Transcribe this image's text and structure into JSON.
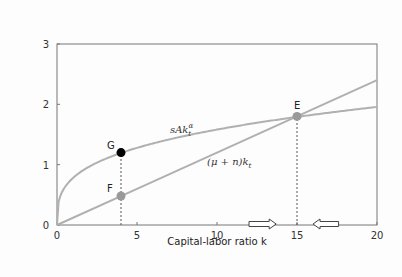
{
  "chart_data": {
    "type": "line",
    "title": "",
    "xlabel": "Capital-labor ratio k",
    "ylabel": "",
    "xlim": [
      0,
      20
    ],
    "ylim": [
      0,
      3
    ],
    "xticks": [
      "0",
      "5",
      "10",
      "15",
      "20"
    ],
    "yticks": [
      "0",
      "1",
      "2",
      "3"
    ],
    "grid": false,
    "series": [
      {
        "name": "sAk_t^α",
        "label_text": "sAk",
        "label_sub": "t",
        "label_sup": "α",
        "function": "0.78*k^0.307",
        "color": "#b0b0b0",
        "x": [
          0,
          1,
          2,
          4,
          6,
          8,
          10,
          12,
          15,
          18,
          20
        ],
        "values": [
          0,
          0.78,
          0.96,
          1.2,
          1.35,
          1.47,
          1.58,
          1.68,
          1.8,
          1.9,
          1.96
        ]
      },
      {
        "name": "(μ + n)k_t",
        "label_text": "(μ + n)k",
        "label_sub": "t",
        "function": "0.12*k",
        "color": "#b0b0b0",
        "x": [
          0,
          5,
          10,
          15,
          20
        ],
        "values": [
          0,
          0.6,
          1.2,
          1.8,
          2.4
        ]
      }
    ],
    "points": [
      {
        "label": "G",
        "x": 4,
        "y": 1.2,
        "color": "#000000"
      },
      {
        "label": "F",
        "x": 4,
        "y": 0.48,
        "color": "#999999"
      },
      {
        "label": "E",
        "x": 15,
        "y": 1.8,
        "color": "#999999"
      }
    ],
    "annotations": [
      {
        "type": "arrow-right",
        "x_from": 12,
        "x_to": 13.7,
        "y": 0
      },
      {
        "type": "arrow-left",
        "x_from": 17.6,
        "x_to": 16,
        "y": 0
      },
      {
        "type": "dashed-vline",
        "x": 4,
        "y_to": 1.2
      },
      {
        "type": "dashed-vline",
        "x": 15,
        "y_to": 1.8
      }
    ]
  }
}
